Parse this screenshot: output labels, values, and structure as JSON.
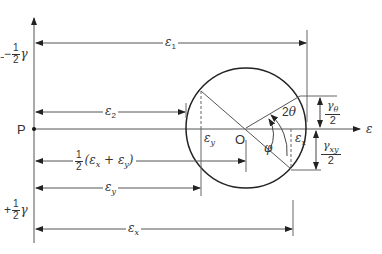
{
  "diagram": {
    "type": "mohr-circle-strain",
    "colors": {
      "line": "#444444",
      "circle": "#222222",
      "text": "#333333"
    },
    "labels": {
      "left_top": {
        "sign": "−",
        "num": "1",
        "den": "2",
        "var": "γ"
      },
      "left_bottom": {
        "sign": "+",
        "num": "1",
        "den": "2",
        "var": "γ"
      },
      "point_P": "P",
      "origin_O": "O",
      "axis_eps": "ε",
      "eps1": {
        "base": "ε",
        "sub": "1"
      },
      "eps2": {
        "base": "ε",
        "sub": "2"
      },
      "epsy_inner": {
        "base": "ε",
        "sub": "y"
      },
      "epsx_inner": {
        "base": "ε",
        "sub": "x"
      },
      "mid": {
        "num": "1",
        "den": "2",
        "expr": "(ε",
        "sx": "x",
        "plus": " + ε",
        "sy": "y",
        "close": ")"
      },
      "epsy_dim": {
        "base": "ε",
        "sub": "y"
      },
      "epsx_dim": {
        "base": "ε",
        "sub": "x"
      },
      "two_theta": "2θ",
      "phi": "φ",
      "gamma_theta": {
        "num_base": "γ",
        "num_sub": "θ",
        "den": "2"
      },
      "gamma_xy": {
        "num_base": "γ",
        "num_sub": "xy",
        "den": "2"
      }
    }
  }
}
